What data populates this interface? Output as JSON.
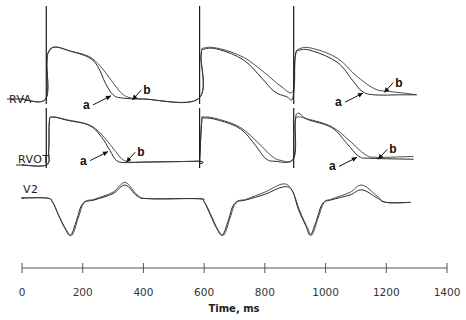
{
  "chart_data": {
    "type": "line",
    "title": "",
    "xlabel": "Time, ms",
    "ylabel": "",
    "xlim": [
      0,
      1400
    ],
    "x_ticks": [
      0,
      200,
      400,
      600,
      800,
      1000,
      1200,
      1400
    ],
    "x_tick_labels": [
      "0",
      "200",
      "400",
      "600",
      "800",
      "1000",
      "1200",
      "1400"
    ],
    "grid": false,
    "stimulus_times_ms": [
      80,
      585,
      895
    ],
    "channels": [
      {
        "name": "RVA",
        "label": "RVA",
        "description": "Monophasic action potential, right ventricular apex",
        "series": [
          {
            "name": "a",
            "points": [
              [
                0,
                0
              ],
              [
                78,
                0
              ],
              [
                82,
                0.7
              ],
              [
                88,
                0.9
              ],
              [
                110,
                1.0
              ],
              [
                160,
                0.92
              ],
              [
                220,
                0.8
              ],
              [
                250,
                0.62
              ],
              [
                275,
                0.3
              ],
              [
                300,
                0.08
              ],
              [
                330,
                0.02
              ],
              [
                400,
                0.0
              ],
              [
                580,
                0.0
              ],
              [
                590,
                0.82
              ],
              [
                600,
                0.96
              ],
              [
                650,
                0.95
              ],
              [
                730,
                0.75
              ],
              [
                790,
                0.4
              ],
              [
                830,
                0.15
              ],
              [
                870,
                0.05
              ],
              [
                893,
                0.04
              ],
              [
                900,
                0.8
              ],
              [
                915,
                0.94
              ],
              [
                960,
                0.92
              ],
              [
                1040,
                0.7
              ],
              [
                1090,
                0.35
              ],
              [
                1120,
                0.15
              ],
              [
                1160,
                0.08
              ],
              [
                1250,
                0.08
              ],
              [
                1300,
                0.08
              ]
            ]
          },
          {
            "name": "b",
            "points": [
              [
                0,
                0
              ],
              [
                78,
                0
              ],
              [
                82,
                0.7
              ],
              [
                88,
                0.92
              ],
              [
                110,
                1.0
              ],
              [
                160,
                0.92
              ],
              [
                220,
                0.82
              ],
              [
                260,
                0.62
              ],
              [
                295,
                0.35
              ],
              [
                330,
                0.1
              ],
              [
                360,
                0.02
              ],
              [
                400,
                0.0
              ],
              [
                580,
                0.0
              ],
              [
                590,
                0.85
              ],
              [
                600,
                0.98
              ],
              [
                650,
                0.97
              ],
              [
                730,
                0.8
              ],
              [
                800,
                0.5
              ],
              [
                850,
                0.26
              ],
              [
                893,
                0.15
              ],
              [
                900,
                0.82
              ],
              [
                915,
                0.97
              ],
              [
                960,
                0.97
              ],
              [
                1040,
                0.78
              ],
              [
                1100,
                0.45
              ],
              [
                1160,
                0.2
              ],
              [
                1200,
                0.15
              ],
              [
                1250,
                0.12
              ],
              [
                1300,
                0.08
              ]
            ]
          }
        ],
        "annotations": [
          {
            "label": "a",
            "x": 300,
            "target_series": "a"
          },
          {
            "label": "b",
            "x": 360,
            "target_series": "b"
          },
          {
            "label": "a",
            "x": 1130,
            "target_series": "a"
          },
          {
            "label": "b",
            "x": 1190,
            "target_series": "b"
          }
        ]
      },
      {
        "name": "RVOT",
        "label": "RVOT",
        "description": "Monophasic action potential, right ventricular outflow tract",
        "series": [
          {
            "name": "a",
            "points": [
              [
                0,
                0
              ],
              [
                80,
                0
              ],
              [
                88,
                0.3
              ],
              [
                90,
                0.9
              ],
              [
                100,
                1.0
              ],
              [
                150,
                0.93
              ],
              [
                220,
                0.83
              ],
              [
                260,
                0.6
              ],
              [
                290,
                0.3
              ],
              [
                310,
                0.1
              ],
              [
                340,
                0.05
              ],
              [
                400,
                0.06
              ],
              [
                580,
                0.08
              ],
              [
                585,
                0.1
              ],
              [
                592,
                0.9
              ],
              [
                600,
                0.98
              ],
              [
                650,
                0.93
              ],
              [
                720,
                0.75
              ],
              [
                770,
                0.4
              ],
              [
                800,
                0.15
              ],
              [
                830,
                0.08
              ],
              [
                895,
                0.14
              ],
              [
                900,
                0.9
              ],
              [
                910,
                1.08
              ],
              [
                940,
                0.95
              ],
              [
                1020,
                0.78
              ],
              [
                1070,
                0.45
              ],
              [
                1110,
                0.18
              ],
              [
                1150,
                0.14
              ],
              [
                1290,
                0.12
              ]
            ]
          },
          {
            "name": "b",
            "points": [
              [
                0,
                0
              ],
              [
                80,
                0
              ],
              [
                88,
                0.3
              ],
              [
                90,
                0.88
              ],
              [
                100,
                1.0
              ],
              [
                150,
                0.94
              ],
              [
                220,
                0.84
              ],
              [
                260,
                0.65
              ],
              [
                300,
                0.35
              ],
              [
                330,
                0.12
              ],
              [
                360,
                0.06
              ],
              [
                400,
                0.06
              ],
              [
                580,
                0.08
              ],
              [
                585,
                0.1
              ],
              [
                592,
                0.9
              ],
              [
                600,
                1.0
              ],
              [
                650,
                0.95
              ],
              [
                720,
                0.78
              ],
              [
                780,
                0.45
              ],
              [
                820,
                0.2
              ],
              [
                850,
                0.1
              ],
              [
                895,
                0.14
              ],
              [
                900,
                0.88
              ],
              [
                910,
                1.0
              ],
              [
                940,
                0.96
              ],
              [
                1020,
                0.8
              ],
              [
                1080,
                0.5
              ],
              [
                1130,
                0.22
              ],
              [
                1170,
                0.16
              ],
              [
                1290,
                0.18
              ]
            ]
          }
        ],
        "annotations": [
          {
            "label": "a",
            "x": 290,
            "target_series": "a"
          },
          {
            "label": "b",
            "x": 340,
            "target_series": "b"
          },
          {
            "label": "a",
            "x": 1110,
            "target_series": "a"
          },
          {
            "label": "b",
            "x": 1170,
            "target_series": "b"
          }
        ]
      },
      {
        "name": "V2",
        "label": "V2",
        "description": "Surface ECG lead V2",
        "series": [
          {
            "name": "a",
            "points": [
              [
                0,
                0
              ],
              [
                80,
                0
              ],
              [
                100,
                -0.1
              ],
              [
                120,
                -0.45
              ],
              [
                140,
                -0.8
              ],
              [
                160,
                -1.0
              ],
              [
                180,
                -0.6
              ],
              [
                200,
                -0.15
              ],
              [
                240,
                -0.05
              ],
              [
                300,
                0.12
              ],
              [
                340,
                0.35
              ],
              [
                380,
                0.05
              ],
              [
                420,
                -0.02
              ],
              [
                580,
                -0.02
              ],
              [
                600,
                -0.1
              ],
              [
                620,
                -0.45
              ],
              [
                640,
                -0.8
              ],
              [
                660,
                -1.0
              ],
              [
                680,
                -0.6
              ],
              [
                700,
                -0.15
              ],
              [
                740,
                -0.05
              ],
              [
                800,
                0.1
              ],
              [
                860,
                0.3
              ],
              [
                890,
                0.2
              ],
              [
                910,
                -0.3
              ],
              [
                935,
                -0.75
              ],
              [
                950,
                -1.0
              ],
              [
                970,
                -0.6
              ],
              [
                990,
                -0.15
              ],
              [
                1020,
                -0.05
              ],
              [
                1080,
                0.08
              ],
              [
                1120,
                0.22
              ],
              [
                1170,
                0.0
              ],
              [
                1200,
                -0.12
              ],
              [
                1280,
                -0.12
              ]
            ]
          },
          {
            "name": "b",
            "points": [
              [
                0,
                0
              ],
              [
                80,
                0
              ],
              [
                100,
                -0.1
              ],
              [
                120,
                -0.45
              ],
              [
                145,
                -0.85
              ],
              [
                165,
                -1.0
              ],
              [
                185,
                -0.55
              ],
              [
                205,
                -0.12
              ],
              [
                240,
                -0.03
              ],
              [
                300,
                0.16
              ],
              [
                340,
                0.42
              ],
              [
                380,
                0.08
              ],
              [
                420,
                -0.02
              ],
              [
                580,
                -0.02
              ],
              [
                600,
                -0.1
              ],
              [
                625,
                -0.5
              ],
              [
                645,
                -0.85
              ],
              [
                665,
                -1.0
              ],
              [
                685,
                -0.55
              ],
              [
                705,
                -0.12
              ],
              [
                740,
                -0.03
              ],
              [
                800,
                0.16
              ],
              [
                860,
                0.38
              ],
              [
                890,
                0.2
              ],
              [
                915,
                -0.35
              ],
              [
                940,
                -0.8
              ],
              [
                955,
                -1.0
              ],
              [
                975,
                -0.55
              ],
              [
                995,
                -0.12
              ],
              [
                1020,
                -0.03
              ],
              [
                1080,
                0.15
              ],
              [
                1120,
                0.35
              ],
              [
                1170,
                0.05
              ],
              [
                1200,
                -0.12
              ],
              [
                1280,
                -0.12
              ]
            ]
          }
        ],
        "annotations": []
      }
    ],
    "legend": "none (traces labeled inline with arrows 'a' and 'b')"
  },
  "colors": {
    "trace": "#2a2a2a",
    "axis": "#555555",
    "background": "#ffffff"
  }
}
